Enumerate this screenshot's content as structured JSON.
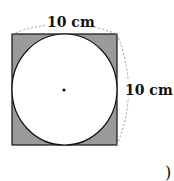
{
  "figure": {
    "top_label": "10 cm",
    "right_label": "10 cm",
    "answer_paren": ")",
    "shade_color": "#9a9a9a",
    "line_color": "#111111",
    "dash_color": "#999999"
  }
}
